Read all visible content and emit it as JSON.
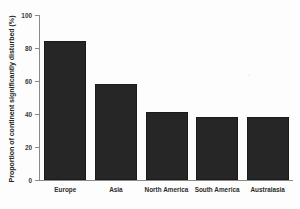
{
  "chart_data": {
    "type": "bar",
    "title": "",
    "xlabel": "",
    "ylabel": "Proportion of continent significantly disturbed (%)",
    "categories": [
      "Europe",
      "Asia",
      "North America",
      "South America",
      "Australasia"
    ],
    "values": [
      84,
      58,
      41,
      38,
      38
    ],
    "ylim": [
      0,
      100
    ],
    "yticks": [
      0,
      20,
      40,
      60,
      80,
      100
    ],
    "ytick_labels": [
      "0",
      "20",
      "40",
      "60",
      "80",
      "100"
    ],
    "grid": false,
    "legend": null,
    "bar_color": "#262626",
    "axis_color": "#8a8a8a",
    "background_color": "#fdfdfd"
  }
}
